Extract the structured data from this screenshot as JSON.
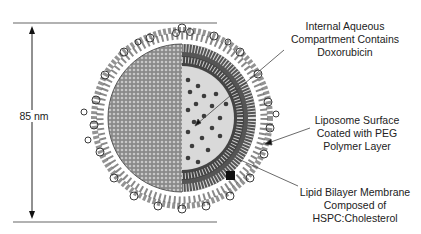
{
  "diagram": {
    "dimension": {
      "label": "85 nm"
    },
    "callouts": [
      {
        "id": "internal-aqueous",
        "lines": [
          "Internal Aqueous",
          "Compartment Contains",
          "Doxorubicin"
        ]
      },
      {
        "id": "peg-surface",
        "lines": [
          "Liposome Surface",
          "Coated with PEG",
          "Polymer Layer"
        ]
      },
      {
        "id": "lipid-bilayer",
        "lines": [
          "Lipid Bilayer Membrane",
          "Composed of",
          "HSPC:Cholesterol"
        ]
      }
    ],
    "colors": {
      "peg_coil": "#3a3a3a",
      "surface": "#7a7a7a",
      "bilayer": "#4d4d4d",
      "aqueous": "#d9d9d9",
      "drug_dot": "#3c3c3c",
      "line": "#555555"
    }
  }
}
